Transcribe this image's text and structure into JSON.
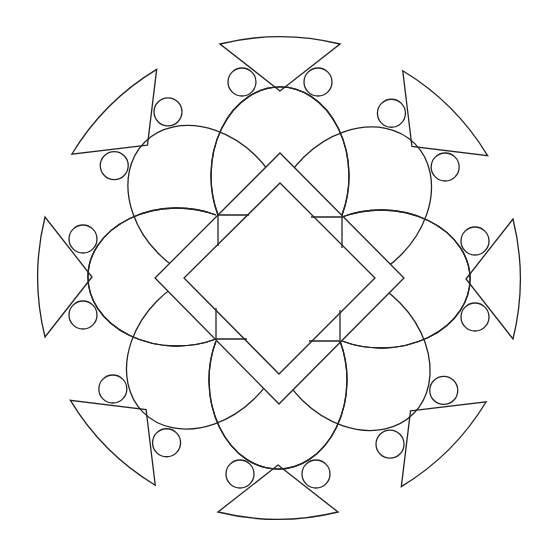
{
  "figure": {
    "type": "mandala-line-art",
    "title": "",
    "stroke_color": "#222222",
    "background": "#ffffff",
    "symmetry": "8-fold rotational",
    "center": [
      279,
      278
    ],
    "elements": {
      "petals": 8,
      "fans": 8,
      "small_circles": 16,
      "diamonds": 2
    }
  }
}
